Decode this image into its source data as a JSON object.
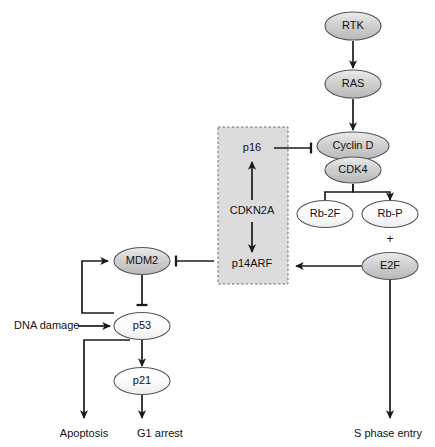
{
  "figure": {
    "type": "biological-pathway-diagram",
    "title": "",
    "width": 435,
    "height": 447,
    "background": "#ffffff"
  },
  "colors": {
    "node_gray_fill": "#c9c9c9",
    "node_gray_top": "#e8e8e8",
    "node_light_fill": "#f4f4f4",
    "node_light_top": "#ffffff",
    "node_stroke": "#55555a",
    "edge_stroke": "#1a1a1a",
    "region_fill": "#dcdcdc",
    "region_stroke": "#6d6d6d",
    "text": "#111111"
  },
  "region": {
    "name": "CDKN2A locus",
    "x": 218,
    "y": 127,
    "width": 70,
    "height": 157
  },
  "nodes": [
    {
      "id": "rtk",
      "label": "RTK",
      "cx": 353,
      "cy": 26,
      "rx": 28,
      "ry": 14,
      "shade": "gray"
    },
    {
      "id": "ras",
      "label": "RAS",
      "cx": 353,
      "cy": 84,
      "rx": 28,
      "ry": 14,
      "shade": "gray"
    },
    {
      "id": "cyclind",
      "label": "Cyclin D",
      "cx": 353,
      "cy": 146,
      "rx": 36,
      "ry": 14,
      "shade": "gray"
    },
    {
      "id": "cdk4",
      "label": "CDK4",
      "cx": 353,
      "cy": 170,
      "rx": 28,
      "ry": 13,
      "shade": "gray"
    },
    {
      "id": "rb2f",
      "label": "Rb-2F",
      "cx": 325,
      "cy": 214,
      "rx": 28,
      "ry": 13.5,
      "shade": "light"
    },
    {
      "id": "rbp",
      "label": "Rb-P",
      "cx": 390,
      "cy": 214,
      "rx": 28,
      "ry": 13.5,
      "shade": "light"
    },
    {
      "id": "e2f",
      "label": "E2F",
      "cx": 390,
      "cy": 266,
      "rx": 28,
      "ry": 13.5,
      "shade": "gray"
    },
    {
      "id": "mdm2",
      "label": "MDM2",
      "cx": 142,
      "cy": 261,
      "rx": 28,
      "ry": 13.5,
      "shade": "gray"
    },
    {
      "id": "p53",
      "label": "p53",
      "cx": 142,
      "cy": 326,
      "rx": 28,
      "ry": 13.5,
      "shade": "light"
    },
    {
      "id": "p21",
      "label": "p21",
      "cx": 142,
      "cy": 381,
      "rx": 28,
      "ry": 13.5,
      "shade": "light"
    }
  ],
  "region_nodes": [
    {
      "id": "p16",
      "label": "p16",
      "x": 252,
      "y": 148
    },
    {
      "id": "cdkn2a",
      "label": "CDKN2A",
      "x": 252,
      "y": 211
    },
    {
      "id": "p14arf",
      "label": "p14ARF",
      "x": 252,
      "y": 264
    }
  ],
  "plain_labels": [
    {
      "id": "dna-damage",
      "label": "DNA damage",
      "x": 14,
      "y": 326,
      "anchor": "start"
    },
    {
      "id": "apoptosis",
      "label": "Apoptosis",
      "x": 84,
      "y": 434,
      "anchor": "middle"
    },
    {
      "id": "g1-arrest",
      "label": "G1 arrest",
      "x": 160,
      "y": 434,
      "anchor": "middle"
    },
    {
      "id": "s-phase-entry",
      "label": "S phase entry",
      "x": 388,
      "y": 434,
      "anchor": "middle"
    },
    {
      "id": "rbp-e2f-plus",
      "label": "+",
      "x": 390,
      "y": 240,
      "anchor": "middle"
    }
  ],
  "edges": [
    {
      "id": "rtk-to-ras",
      "from": "RTK",
      "to": "RAS",
      "kind": "activation",
      "path": "M 353 41 L 353 68",
      "head": "arrow"
    },
    {
      "id": "ras-to-cyclind",
      "from": "RAS",
      "to": "Cyclin D",
      "kind": "activation",
      "path": "M 353 99 L 353 130",
      "head": "arrow"
    },
    {
      "id": "p16-to-cyclind",
      "from": "p16",
      "to": "Cyclin D",
      "kind": "inhibition",
      "path": "M 274 148 L 311 148",
      "head": "bar"
    },
    {
      "id": "cdkn2a-to-p16",
      "from": "CDKN2A",
      "to": "p16",
      "kind": "activation",
      "path": "M 252 200 L 252 162",
      "head": "arrow"
    },
    {
      "id": "cdkn2a-to-p14arf",
      "from": "CDKN2A",
      "to": "p14ARF",
      "kind": "activation",
      "path": "M 252 222 L 252 252",
      "head": "arrow"
    },
    {
      "id": "cdk4-to-rb2f",
      "from": "CDK4",
      "to": "Rb-2F",
      "kind": "activation",
      "path": "M 353 184 L 353 192 L 325 192 L 325 200",
      "head": "none"
    },
    {
      "id": "cdk4-to-rbp",
      "from": "CDK4",
      "to": "Rb-P",
      "kind": "activation",
      "path": "M 353 184 L 353 192 L 390 192 L 390 200",
      "head": "arrow"
    },
    {
      "id": "e2f-to-p14arf",
      "from": "E2F",
      "to": "p14ARF",
      "kind": "activation",
      "path": "M 362 266 L 296 266",
      "head": "arrow"
    },
    {
      "id": "p14arf-to-mdm2",
      "from": "p14ARF",
      "to": "MDM2",
      "kind": "inhibition",
      "path": "M 214 261 L 176 261",
      "head": "bar"
    },
    {
      "id": "e2f-to-sphase",
      "from": "E2F",
      "to": "S phase entry",
      "kind": "activation",
      "path": "M 390 280 L 390 418",
      "head": "arrow"
    },
    {
      "id": "mdm2-to-p53",
      "from": "MDM2",
      "to": "p53",
      "kind": "inhibition",
      "path": "M 142 275 L 142 305",
      "head": "bar"
    },
    {
      "id": "p53-to-mdm2",
      "from": "p53",
      "to": "MDM2",
      "kind": "activation",
      "path": "M 114 313 L 82 313 L 82 261 L 108 261",
      "head": "arrow"
    },
    {
      "id": "dnadamage-to-p53",
      "from": "DNA damage",
      "to": "p53",
      "kind": "activation",
      "path": "M 78 326 L 110 326",
      "head": "arrow"
    },
    {
      "id": "p53-to-apoptosis",
      "from": "p53",
      "to": "Apoptosis",
      "kind": "activation",
      "path": "M 130 340 L 84 340 L 84 418",
      "head": "arrow"
    },
    {
      "id": "p53-to-p21",
      "from": "p53",
      "to": "p21",
      "kind": "activation",
      "path": "M 142 340 L 142 366",
      "head": "arrow"
    },
    {
      "id": "p21-to-g1arrest",
      "from": "p21",
      "to": "G1 arrest",
      "kind": "activation",
      "path": "M 142 395 L 142 418",
      "head": "arrow"
    }
  ]
}
